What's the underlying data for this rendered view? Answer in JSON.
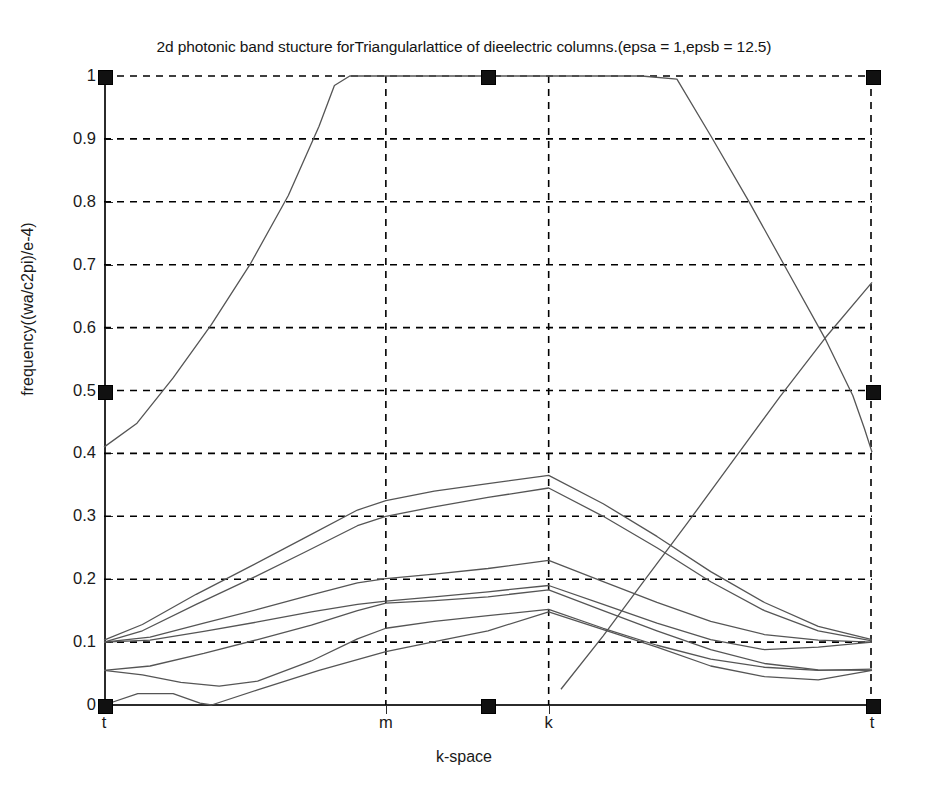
{
  "chart_data": {
    "type": "line",
    "title": "2d photonic band stucture forTriangularlattice of dieelectric columns.(epsa = 1,epsb = 12.5)",
    "xlabel": "k-space",
    "ylabel": "frequency((wa/c2pi)/e-4)",
    "xlim": [
      0,
      1
    ],
    "ylim": [
      0,
      1
    ],
    "grid": true,
    "legend": "none",
    "line_color": "#555555",
    "grid_color": "#000000",
    "axis_color": "#2b2b2b",
    "marker_color": "#111111",
    "xtick_positions": [
      0.0,
      0.367,
      0.579
    ],
    "xtick_labels": [
      "t",
      "m",
      "k",
      "t"
    ],
    "xtick_all_positions": [
      0.0,
      0.367,
      0.579,
      1.0
    ],
    "ytick_labels": [
      "0",
      "0.1",
      "0.2",
      "0.3",
      "0.4",
      "0.5",
      "0.6",
      "0.7",
      "0.8",
      "0.9",
      "1"
    ],
    "ytick_values": [
      0,
      0.1,
      0.2,
      0.3,
      0.4,
      0.5,
      0.6,
      0.7,
      0.8,
      0.9,
      1.0
    ],
    "symmetry_points": {
      "t_left": 0.0,
      "m": 0.367,
      "k": 0.579,
      "t_right": 1.0
    },
    "axis_markers": [
      {
        "x": 0.0,
        "y": 1.0
      },
      {
        "x": 0.499,
        "y": 1.0
      },
      {
        "x": 1.0,
        "y": 1.0
      },
      {
        "x": 0.0,
        "y": 0.5
      },
      {
        "x": 1.0,
        "y": 0.5
      },
      {
        "x": 0.0,
        "y": 0.0
      },
      {
        "x": 0.499,
        "y": 0.0
      },
      {
        "x": 1.0,
        "y": 0.0
      }
    ],
    "series": [
      {
        "name": "band-1",
        "points": [
          [
            0.0,
            0.0
          ],
          [
            0.044,
            0.018
          ],
          [
            0.09,
            0.018
          ],
          [
            0.125,
            0.003
          ],
          [
            0.14,
            0.0
          ],
          [
            0.2,
            0.024
          ],
          [
            0.28,
            0.055
          ],
          [
            0.367,
            0.085
          ],
          [
            0.44,
            0.103
          ],
          [
            0.5,
            0.118
          ],
          [
            0.579,
            0.148
          ],
          [
            0.65,
            0.12
          ],
          [
            0.72,
            0.092
          ],
          [
            0.79,
            0.062
          ],
          [
            0.86,
            0.045
          ],
          [
            0.93,
            0.04
          ],
          [
            1.0,
            0.055
          ]
        ]
      },
      {
        "name": "band-2",
        "points": [
          [
            0.0,
            0.055
          ],
          [
            0.05,
            0.048
          ],
          [
            0.1,
            0.036
          ],
          [
            0.15,
            0.03
          ],
          [
            0.2,
            0.038
          ],
          [
            0.27,
            0.07
          ],
          [
            0.33,
            0.105
          ],
          [
            0.367,
            0.122
          ],
          [
            0.43,
            0.133
          ],
          [
            0.5,
            0.142
          ],
          [
            0.579,
            0.152
          ],
          [
            0.65,
            0.122
          ],
          [
            0.72,
            0.095
          ],
          [
            0.79,
            0.073
          ],
          [
            0.86,
            0.06
          ],
          [
            0.93,
            0.055
          ],
          [
            1.0,
            0.057
          ]
        ]
      },
      {
        "name": "band-3",
        "points": [
          [
            0.0,
            0.055
          ],
          [
            0.06,
            0.062
          ],
          [
            0.13,
            0.082
          ],
          [
            0.2,
            0.104
          ],
          [
            0.27,
            0.127
          ],
          [
            0.33,
            0.15
          ],
          [
            0.367,
            0.162
          ],
          [
            0.43,
            0.166
          ],
          [
            0.5,
            0.172
          ],
          [
            0.579,
            0.183
          ],
          [
            0.65,
            0.15
          ],
          [
            0.72,
            0.118
          ],
          [
            0.79,
            0.088
          ],
          [
            0.86,
            0.066
          ],
          [
            0.93,
            0.056
          ],
          [
            1.0,
            0.055
          ]
        ]
      },
      {
        "name": "band-4",
        "points": [
          [
            0.0,
            0.1
          ],
          [
            0.06,
            0.103
          ],
          [
            0.13,
            0.117
          ],
          [
            0.2,
            0.132
          ],
          [
            0.27,
            0.148
          ],
          [
            0.33,
            0.16
          ],
          [
            0.367,
            0.165
          ],
          [
            0.43,
            0.172
          ],
          [
            0.5,
            0.18
          ],
          [
            0.579,
            0.19
          ],
          [
            0.65,
            0.16
          ],
          [
            0.72,
            0.13
          ],
          [
            0.79,
            0.104
          ],
          [
            0.86,
            0.088
          ],
          [
            0.93,
            0.092
          ],
          [
            1.0,
            0.1
          ]
        ]
      },
      {
        "name": "band-5",
        "points": [
          [
            0.0,
            0.1
          ],
          [
            0.06,
            0.108
          ],
          [
            0.13,
            0.13
          ],
          [
            0.2,
            0.152
          ],
          [
            0.27,
            0.175
          ],
          [
            0.33,
            0.194
          ],
          [
            0.367,
            0.201
          ],
          [
            0.43,
            0.208
          ],
          [
            0.5,
            0.217
          ],
          [
            0.579,
            0.23
          ],
          [
            0.65,
            0.196
          ],
          [
            0.72,
            0.163
          ],
          [
            0.79,
            0.133
          ],
          [
            0.86,
            0.112
          ],
          [
            0.93,
            0.103
          ],
          [
            1.0,
            0.1
          ]
        ]
      },
      {
        "name": "band-6",
        "points": [
          [
            0.0,
            0.1
          ],
          [
            0.05,
            0.118
          ],
          [
            0.12,
            0.16
          ],
          [
            0.19,
            0.2
          ],
          [
            0.26,
            0.242
          ],
          [
            0.33,
            0.285
          ],
          [
            0.367,
            0.3
          ],
          [
            0.43,
            0.315
          ],
          [
            0.5,
            0.33
          ],
          [
            0.579,
            0.345
          ],
          [
            0.65,
            0.3
          ],
          [
            0.72,
            0.25
          ],
          [
            0.79,
            0.196
          ],
          [
            0.86,
            0.15
          ],
          [
            0.93,
            0.118
          ],
          [
            1.0,
            0.102
          ]
        ]
      },
      {
        "name": "band-7",
        "points": [
          [
            0.0,
            0.103
          ],
          [
            0.05,
            0.128
          ],
          [
            0.12,
            0.176
          ],
          [
            0.19,
            0.22
          ],
          [
            0.26,
            0.265
          ],
          [
            0.33,
            0.31
          ],
          [
            0.367,
            0.325
          ],
          [
            0.43,
            0.34
          ],
          [
            0.5,
            0.352
          ],
          [
            0.579,
            0.365
          ],
          [
            0.65,
            0.32
          ],
          [
            0.72,
            0.268
          ],
          [
            0.79,
            0.212
          ],
          [
            0.86,
            0.163
          ],
          [
            0.93,
            0.125
          ],
          [
            1.0,
            0.104
          ]
        ]
      },
      {
        "name": "band-8",
        "points": [
          [
            0.595,
            0.025
          ],
          [
            0.65,
            0.11
          ],
          [
            0.7,
            0.192
          ],
          [
            0.76,
            0.29
          ],
          [
            0.82,
            0.39
          ],
          [
            0.88,
            0.49
          ],
          [
            0.94,
            0.585
          ],
          [
            1.0,
            0.672
          ]
        ]
      },
      {
        "name": "band-9",
        "points": [
          [
            0.0,
            0.41
          ],
          [
            0.043,
            0.448
          ],
          [
            0.09,
            0.52
          ],
          [
            0.14,
            0.605
          ],
          [
            0.19,
            0.7
          ],
          [
            0.24,
            0.81
          ],
          [
            0.28,
            0.92
          ],
          [
            0.3,
            0.985
          ],
          [
            0.32,
            1.0
          ],
          [
            0.499,
            1.0
          ],
          [
            0.7,
            1.0
          ],
          [
            0.746,
            0.995
          ],
          [
            0.79,
            0.905
          ],
          [
            0.84,
            0.8
          ],
          [
            0.89,
            0.69
          ],
          [
            0.94,
            0.58
          ],
          [
            0.975,
            0.492
          ],
          [
            0.99,
            0.44
          ],
          [
            1.0,
            0.402
          ]
        ]
      }
    ]
  }
}
